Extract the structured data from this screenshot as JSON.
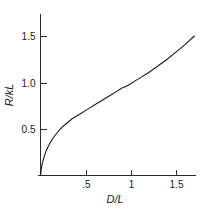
{
  "chart_data": {
    "type": "line",
    "title": "",
    "subtitle": "",
    "xlabel": "D/L",
    "ylabel": "R/kL",
    "xlim": [
      0,
      1.7
    ],
    "ylim": [
      0,
      1.75
    ],
    "grid": false,
    "legend": null,
    "x_ticks": [
      {
        "value": 0.5,
        "label": ".5"
      },
      {
        "value": 1.0,
        "label": "1"
      },
      {
        "value": 1.5,
        "label": "1.5"
      }
    ],
    "y_ticks": [
      {
        "value": 0.5,
        "label": "0.5"
      },
      {
        "value": 1.0,
        "label": "1.0"
      },
      {
        "value": 1.5,
        "label": "1.5"
      }
    ],
    "series": [
      {
        "name": "R/kL",
        "x": [
          0.0,
          0.01,
          0.02,
          0.04,
          0.06,
          0.08,
          0.1,
          0.13,
          0.16,
          0.2,
          0.25,
          0.3,
          0.35,
          0.4,
          0.45,
          0.5,
          0.55,
          0.6,
          0.65,
          0.7,
          0.75,
          0.8,
          0.85,
          0.9,
          0.95,
          1.0,
          1.05,
          1.1,
          1.2,
          1.3,
          1.4,
          1.5,
          1.6,
          1.7
        ],
        "values": [
          0.0,
          0.08,
          0.13,
          0.2,
          0.26,
          0.3,
          0.34,
          0.39,
          0.43,
          0.48,
          0.53,
          0.57,
          0.61,
          0.64,
          0.67,
          0.7,
          0.73,
          0.76,
          0.79,
          0.82,
          0.85,
          0.88,
          0.91,
          0.94,
          0.96,
          0.99,
          1.02,
          1.05,
          1.11,
          1.18,
          1.25,
          1.33,
          1.41,
          1.5
        ]
      }
    ]
  },
  "axes": {
    "x_axis_title": "D/L",
    "y_axis_title": "R/kL",
    "y_axis_title_parts": {
      "numerator": "R",
      "slash": "/",
      "denominator": "kL"
    }
  },
  "colors": {
    "curve": "#1a1a1a",
    "axis": "#2b2b2b",
    "text": "#1a1a1a",
    "background": "#ffffff"
  }
}
